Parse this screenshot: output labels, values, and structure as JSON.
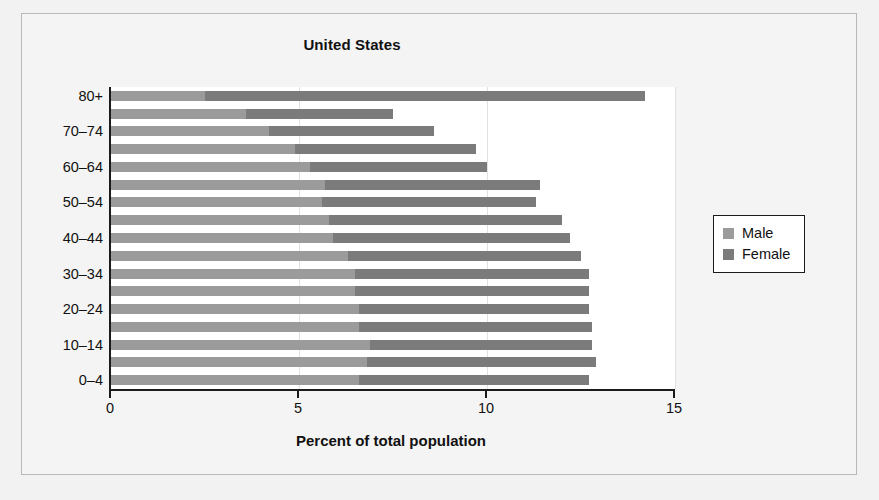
{
  "chart_data": {
    "type": "bar",
    "orientation": "horizontal",
    "stacked": true,
    "title": "United States",
    "xlabel": "Percent of total population",
    "ylabel": "",
    "xlim": [
      0,
      15
    ],
    "xticks": [
      0,
      5,
      10,
      15
    ],
    "xtick_labels": [
      "0",
      "5",
      "10",
      "15"
    ],
    "grid": "vertical",
    "legend_position": "right",
    "categories": [
      "0–4",
      "5–9",
      "10–14",
      "15–19",
      "20–24",
      "25–29",
      "30–34",
      "35–39",
      "40–44",
      "45–49",
      "50–54",
      "55–59",
      "60–64",
      "65–69",
      "70–74",
      "75–79",
      "80+"
    ],
    "ytick_labels_shown": [
      "0–4",
      "10–14",
      "20–24",
      "30–34",
      "40–44",
      "50–54",
      "60–64",
      "70–74",
      "80+"
    ],
    "series": [
      {
        "name": "Male",
        "color": "#9b9b9b",
        "values": [
          6.6,
          6.8,
          6.9,
          6.6,
          6.6,
          6.5,
          6.5,
          6.3,
          5.9,
          5.8,
          5.6,
          5.7,
          5.3,
          4.9,
          4.2,
          3.6,
          2.5
        ]
      },
      {
        "name": "Female",
        "color": "#7b7b7b",
        "values": [
          6.1,
          6.1,
          5.9,
          6.2,
          6.1,
          6.2,
          6.2,
          6.2,
          6.3,
          6.2,
          5.7,
          5.7,
          4.7,
          4.8,
          4.4,
          3.9,
          11.7
        ]
      }
    ],
    "totals": [
      12.7,
      12.9,
      12.8,
      12.8,
      12.7,
      12.7,
      12.7,
      12.5,
      12.2,
      12.0,
      11.3,
      11.4,
      10.0,
      9.7,
      8.6,
      7.5,
      14.2
    ]
  },
  "legend": {
    "items": [
      {
        "label": "Male",
        "color": "#9b9b9b"
      },
      {
        "label": "Female",
        "color": "#7b7b7b"
      }
    ]
  }
}
